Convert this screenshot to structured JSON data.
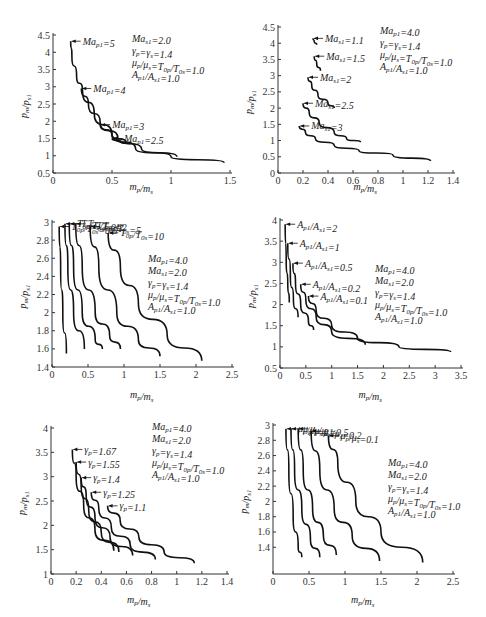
{
  "chart_data": [
    {
      "id": "a",
      "type": "line",
      "xlabel": "m_p/m_s",
      "ylabel": "p_m/p_s1",
      "xlim": [
        0,
        1.5
      ],
      "ylim": [
        0.5,
        4.5
      ],
      "xticks": [
        "0",
        "0.5",
        "1",
        "1.5"
      ],
      "yticks": [
        "0.5",
        "1",
        "1.5",
        "2",
        "2.5",
        "3",
        "3.5",
        "4",
        "4.5"
      ],
      "params": [
        "Ma_s1=2.0",
        "γp=γs=1.4",
        "μp/μs=T0p/T0s=1.0",
        "Ap1/As1=1.0"
      ],
      "series": [
        {
          "name": "Ma_p1=5",
          "points": [
            [
              0.15,
              4.32
            ],
            [
              0.16,
              3.9
            ],
            [
              0.2,
              3.3
            ],
            [
              0.25,
              2.9
            ],
            [
              0.35,
              2.2
            ],
            [
              0.5,
              1.6
            ],
            [
              0.7,
              1.2
            ],
            [
              1.0,
              0.97
            ],
            [
              1.45,
              0.8
            ]
          ]
        },
        {
          "name": "Ma_p1=4",
          "points": [
            [
              0.24,
              2.95
            ],
            [
              0.3,
              2.5
            ],
            [
              0.4,
              1.95
            ],
            [
              0.55,
              1.5
            ],
            [
              0.75,
              1.2
            ],
            [
              1.05,
              0.97
            ]
          ]
        },
        {
          "name": "Ma_p1=3",
          "points": [
            [
              0.4,
              1.9
            ],
            [
              0.5,
              1.6
            ],
            [
              0.62,
              1.38
            ]
          ]
        },
        {
          "name": "Ma_p1=2.5",
          "points": [
            [
              0.5,
              1.5
            ],
            [
              0.58,
              1.4
            ],
            [
              0.65,
              1.33
            ]
          ]
        }
      ]
    },
    {
      "id": "b",
      "type": "line",
      "xlabel": "m_p/m_s",
      "ylabel": "p_m/p_s1",
      "xlim": [
        0,
        1.4
      ],
      "ylim": [
        0,
        4.5
      ],
      "xticks": [
        "0",
        "0.2",
        "0.4",
        "0.6",
        "0.8",
        "1",
        "1.2",
        "1.4"
      ],
      "yticks": [
        "0",
        "0.5",
        "1",
        "1.5",
        "2",
        "2.5",
        "3",
        "3.5",
        "4",
        "4.5"
      ],
      "params": [
        "Ma_p1=4.0",
        "γp=γs=1.4",
        "μp/μs=T0p/T0s=1.0",
        "Ap1/As1=1.0"
      ],
      "series": [
        {
          "name": "Ma_s1=1.1",
          "points": [
            [
              0.28,
              4.15
            ],
            [
              0.29,
              4.05
            ],
            [
              0.31,
              3.95
            ]
          ]
        },
        {
          "name": "Ma_s1=1.5",
          "points": [
            [
              0.29,
              3.6
            ],
            [
              0.31,
              3.35
            ],
            [
              0.34,
              3.15
            ]
          ]
        },
        {
          "name": "Ma_s1=2",
          "points": [
            [
              0.24,
              2.95
            ],
            [
              0.27,
              2.7
            ],
            [
              0.32,
              2.4
            ],
            [
              0.4,
              2.15
            ],
            [
              0.45,
              2.0
            ]
          ]
        },
        {
          "name": "Ma_s1=2.5",
          "points": [
            [
              0.2,
              2.15
            ],
            [
              0.25,
              1.85
            ],
            [
              0.33,
              1.55
            ],
            [
              0.45,
              1.25
            ],
            [
              0.55,
              1.05
            ],
            [
              0.66,
              0.95
            ]
          ]
        },
        {
          "name": "Ma_s1=3",
          "points": [
            [
              0.17,
              1.45
            ],
            [
              0.22,
              1.25
            ],
            [
              0.3,
              1.05
            ],
            [
              0.45,
              0.85
            ],
            [
              0.65,
              0.68
            ],
            [
              0.92,
              0.55
            ],
            [
              1.22,
              0.37
            ]
          ]
        }
      ]
    },
    {
      "id": "c",
      "type": "line",
      "xlabel": "m_p/m_s",
      "ylabel": "p_m/p_s1",
      "xlim": [
        0,
        2.5
      ],
      "ylim": [
        1.4,
        3.0
      ],
      "xticks": [
        "0",
        "0.5",
        "1",
        "1.5",
        "2",
        "2.5"
      ],
      "yticks": [
        "1.4",
        "1.6",
        "1.8",
        "2",
        "2.2",
        "2.4",
        "2.6",
        "2.8",
        "3"
      ],
      "params": [
        "Ma_p1=4.0",
        "Ma_s1=2.0",
        "γp=γs=1.4",
        "μp/μs=T0p/T0s=1.0",
        "Ap1/As1=1.0"
      ],
      "series": [
        {
          "name": "T0p/T0s=0.5",
          "points": [
            [
              0.1,
              2.95
            ],
            [
              0.12,
              2.5
            ],
            [
              0.15,
              2.0
            ],
            [
              0.2,
              1.55
            ]
          ]
        },
        {
          "name": "T0p/T0s=0.2",
          "points": [
            [
              0.18,
              2.98
            ],
            [
              0.22,
              2.5
            ],
            [
              0.3,
              2.0
            ],
            [
              0.45,
              1.6
            ]
          ]
        },
        {
          "name": "T0p/T0s=1",
          "points": [
            [
              0.24,
              2.98
            ],
            [
              0.3,
              2.5
            ],
            [
              0.42,
              2.0
            ],
            [
              0.6,
              1.7
            ],
            [
              0.7,
              1.6
            ]
          ]
        },
        {
          "name": "T0p/T0s=2",
          "points": [
            [
              0.33,
              2.98
            ],
            [
              0.42,
              2.5
            ],
            [
              0.6,
              2.0
            ],
            [
              0.8,
              1.75
            ],
            [
              0.95,
              1.6
            ]
          ]
        },
        {
          "name": "T0p/T0s=5",
          "points": [
            [
              0.53,
              2.95
            ],
            [
              0.65,
              2.5
            ],
            [
              0.9,
              2.0
            ],
            [
              1.2,
              1.7
            ],
            [
              1.5,
              1.52
            ]
          ]
        },
        {
          "name": "T0p/T0s=10",
          "points": [
            [
              0.78,
              2.88
            ],
            [
              0.95,
              2.5
            ],
            [
              1.2,
              2.1
            ],
            [
              1.6,
              1.75
            ],
            [
              2.08,
              1.47
            ]
          ]
        }
      ]
    },
    {
      "id": "d",
      "type": "line",
      "xlabel": "m_p/m_s",
      "ylabel": "p_m/p_s1",
      "xlim": [
        0,
        3.5
      ],
      "ylim": [
        0.5,
        4.0
      ],
      "xticks": [
        "0",
        "0.5",
        "1",
        "1.5",
        "2",
        "2.5",
        "3",
        "3.5"
      ],
      "yticks": [
        "0.5",
        "1",
        "1.5",
        "2",
        "2.5",
        "3",
        "3.5",
        "4"
      ],
      "params": [
        "Ma_p1=4.0",
        "Ma_s1=2.0",
        "γp=γs=1.4",
        "μp/μs=T0p/T0s=1.0",
        "Ap1/As1=1.0"
      ],
      "series": [
        {
          "name": "Ap1/As1=2",
          "points": [
            [
              0.1,
              3.9
            ],
            [
              0.12,
              3.0
            ],
            [
              0.15,
              2.5
            ],
            [
              0.18,
              2.05
            ]
          ]
        },
        {
          "name": "Ap1/As1=1",
          "points": [
            [
              0.15,
              3.45
            ],
            [
              0.2,
              2.7
            ],
            [
              0.26,
              2.1
            ],
            [
              0.35,
              1.7
            ]
          ]
        },
        {
          "name": "Ap1/As1=0.5",
          "points": [
            [
              0.25,
              2.98
            ],
            [
              0.3,
              2.5
            ],
            [
              0.4,
              2.0
            ],
            [
              0.55,
              1.6
            ],
            [
              0.65,
              1.4
            ]
          ]
        },
        {
          "name": "Ap1/As1=0.2",
          "points": [
            [
              0.4,
              2.48
            ],
            [
              0.5,
              2.1
            ],
            [
              0.7,
              1.7
            ],
            [
              1.0,
              1.35
            ],
            [
              1.65,
              1.05
            ]
          ]
        },
        {
          "name": "Ap1/As1=0.1",
          "points": [
            [
              0.55,
              2.2
            ],
            [
              0.7,
              1.85
            ],
            [
              1.0,
              1.5
            ],
            [
              1.5,
              1.2
            ],
            [
              2.3,
              1.0
            ],
            [
              3.3,
              0.88
            ]
          ]
        }
      ]
    },
    {
      "id": "e",
      "type": "line",
      "xlabel": "m_p/m_s",
      "ylabel": "p_m/p_s1",
      "xlim": [
        0,
        1.4
      ],
      "ylim": [
        1,
        4
      ],
      "xticks": [
        "0",
        "0.2",
        "0.4",
        "0.6",
        "0.8",
        "1",
        "1.2",
        "1.4"
      ],
      "yticks": [
        "1",
        "1.5",
        "2",
        "2.5",
        "3",
        "3.5",
        "4"
      ],
      "params": [
        "Ma_p1=4.0",
        "Ma_s1=2.0",
        "γp=γs=1.4",
        "μp/μs=T0p/T0s=1.0",
        "Ap1/As1=1.0"
      ],
      "series": [
        {
          "name": "γp=1.67",
          "points": [
            [
              0.17,
              3.56
            ],
            [
              0.2,
              3.0
            ],
            [
              0.26,
              2.4
            ],
            [
              0.35,
              1.9
            ],
            [
              0.5,
              1.48
            ]
          ]
        },
        {
          "name": "γp=1.55",
          "points": [
            [
              0.2,
              3.3
            ],
            [
              0.24,
              2.8
            ],
            [
              0.3,
              2.3
            ],
            [
              0.4,
              1.85
            ],
            [
              0.54,
              1.45
            ]
          ]
        },
        {
          "name": "γp=1.4",
          "points": [
            [
              0.24,
              2.98
            ],
            [
              0.28,
              2.6
            ],
            [
              0.35,
              2.15
            ],
            [
              0.47,
              1.75
            ],
            [
              0.65,
              1.38
            ]
          ]
        },
        {
          "name": "γp=1.25",
          "points": [
            [
              0.32,
              2.68
            ],
            [
              0.38,
              2.35
            ],
            [
              0.48,
              1.95
            ],
            [
              0.63,
              1.6
            ],
            [
              0.83,
              1.3
            ]
          ]
        },
        {
          "name": "γp=1.1",
          "points": [
            [
              0.45,
              2.4
            ],
            [
              0.55,
              2.1
            ],
            [
              0.7,
              1.75
            ],
            [
              0.9,
              1.45
            ],
            [
              1.14,
              1.22
            ]
          ]
        }
      ]
    },
    {
      "id": "f",
      "type": "line",
      "xlabel": "m_p/m_s",
      "ylabel": "p_m/p_s1",
      "xlim": [
        0,
        2.5
      ],
      "ylim": [
        1.05,
        3.0
      ],
      "xticks": [
        "0",
        "0.5",
        "1",
        "1.5",
        "2",
        "2.5"
      ],
      "yticks": [
        "1.4",
        "1.6",
        "1.8",
        "2",
        "2.2",
        "2.4",
        "2.6",
        "2.8",
        "3"
      ],
      "params": [
        "Ma_p1=4.0",
        "Ma_s1=2.0",
        "γp=γs=1.4",
        "μp/μs=T0p/T0s=1.0",
        "Ap1/As1=1.0"
      ],
      "series": [
        {
          "name": "μp/μs=2",
          "points": [
            [
              0.18,
              2.95
            ],
            [
              0.22,
              2.4
            ],
            [
              0.28,
              1.8
            ],
            [
              0.35,
              1.4
            ],
            [
              0.4,
              1.27
            ]
          ]
        },
        {
          "name": "μp/μs=1",
          "points": [
            [
              0.25,
              2.95
            ],
            [
              0.3,
              2.4
            ],
            [
              0.4,
              1.9
            ],
            [
              0.52,
              1.5
            ],
            [
              0.65,
              1.27
            ]
          ]
        },
        {
          "name": "μp/μs=0.5",
          "points": [
            [
              0.35,
              2.95
            ],
            [
              0.42,
              2.4
            ],
            [
              0.55,
              1.9
            ],
            [
              0.7,
              1.55
            ],
            [
              0.88,
              1.3
            ]
          ]
        },
        {
          "name": "μp/μs=0.2",
          "points": [
            [
              0.53,
              2.92
            ],
            [
              0.65,
              2.4
            ],
            [
              0.85,
              1.9
            ],
            [
              1.1,
              1.55
            ],
            [
              1.48,
              1.22
            ]
          ]
        },
        {
          "name": "μp/μs=0.1",
          "points": [
            [
              0.77,
              2.86
            ],
            [
              0.9,
              2.5
            ],
            [
              1.15,
              2.0
            ],
            [
              1.5,
              1.6
            ],
            [
              2.08,
              1.2
            ]
          ]
        }
      ]
    }
  ]
}
